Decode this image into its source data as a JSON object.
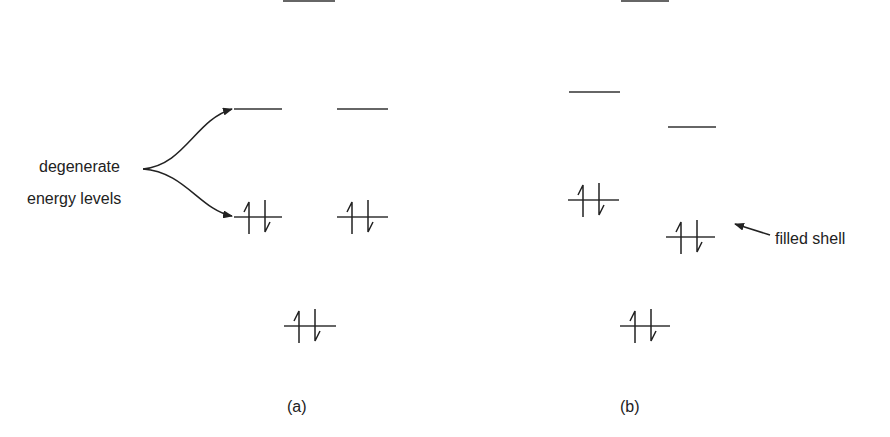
{
  "diagram": {
    "annotations": {
      "degenerate_line1": "degenerate",
      "degenerate_line2": "energy levels",
      "filled_shell": "filled shell"
    },
    "panels": [
      {
        "label": "(a)",
        "levels": [
          {
            "x": 283,
            "w": 52,
            "y": 1,
            "electrons": 0
          },
          {
            "x": 234,
            "w": 48,
            "y": 109,
            "electrons": 0
          },
          {
            "x": 337,
            "w": 51,
            "y": 109,
            "electrons": 0
          },
          {
            "x": 234,
            "w": 48,
            "y": 217,
            "electrons": 2
          },
          {
            "x": 337,
            "w": 51,
            "y": 217,
            "electrons": 2
          },
          {
            "x": 284,
            "w": 52,
            "y": 326,
            "electrons": 2
          }
        ]
      },
      {
        "label": "(b)",
        "levels": [
          {
            "x": 621,
            "w": 48,
            "y": 1,
            "electrons": 0
          },
          {
            "x": 569,
            "w": 51,
            "y": 92,
            "electrons": 0
          },
          {
            "x": 668,
            "w": 48,
            "y": 127,
            "electrons": 0
          },
          {
            "x": 568,
            "w": 51,
            "y": 200,
            "electrons": 2
          },
          {
            "x": 666,
            "w": 49,
            "y": 237,
            "electrons": 2
          },
          {
            "x": 620,
            "w": 50,
            "y": 326,
            "electrons": 2
          }
        ]
      }
    ]
  }
}
